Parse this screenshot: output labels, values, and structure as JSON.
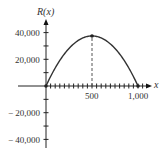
{
  "chart_data": {
    "type": "line",
    "title": "",
    "xlabel": "x",
    "ylabel": "R(x)",
    "x": [
      0,
      100,
      200,
      300,
      400,
      500,
      600,
      700,
      800,
      900,
      1000
    ],
    "series": [
      {
        "name": "R(x)",
        "values": [
          0,
          13500,
          24000,
          31500,
          36000,
          37500,
          36000,
          31500,
          24000,
          13500,
          0
        ]
      }
    ],
    "marked_points": [
      [
        0,
        0
      ],
      [
        500,
        37500
      ],
      [
        1000,
        0
      ]
    ],
    "annotations": [
      "dashed vertical line from x=500 up to the maximum"
    ],
    "x_ticks": [
      "500",
      "1,000"
    ],
    "y_ticks": [
      "40,000",
      "20,000",
      "-20,000",
      "-40,000"
    ],
    "xlim": [
      -300,
      1100
    ],
    "ylim": [
      -45000,
      50000
    ],
    "grid": false,
    "legend": "none"
  },
  "labels": {
    "y_axis": "R(x)",
    "x_axis": "x",
    "y40k": "40,000",
    "y20k": "20,000",
    "yn20k": "− 20,000",
    "yn40k": "− 40,000",
    "x500": "500",
    "x1000": "1,000"
  },
  "colors": {
    "line": "#333333",
    "axis": "#222222"
  }
}
